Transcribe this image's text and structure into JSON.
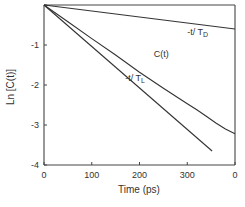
{
  "chart_data": {
    "type": "line",
    "title": "",
    "xlabel": "Time (ps)",
    "ylabel": "Ln [C(t)]",
    "xlim": [
      0,
      400
    ],
    "ylim": [
      -4,
      0
    ],
    "xticks": [
      0,
      100,
      200,
      300,
      400
    ],
    "xtick_labels": [
      "0",
      "100",
      "200",
      "300",
      "0"
    ],
    "yticks": [
      0,
      -1,
      -2,
      -3,
      -4
    ],
    "ytick_labels": [
      "",
      "-1",
      "-2",
      "-3",
      "-4"
    ],
    "grid": false,
    "legend": "none",
    "series": [
      {
        "name": "-t/T_D",
        "label_main": "-t/ T",
        "label_sub": "D",
        "x": [
          0,
          400
        ],
        "y": [
          0,
          -0.6
        ]
      },
      {
        "name": "C(t)",
        "label_main": "C(t)",
        "label_sub": "",
        "x": [
          0,
          50,
          100,
          150,
          200,
          250,
          300,
          320,
          340,
          360,
          380,
          400
        ],
        "y": [
          0,
          -0.42,
          -0.84,
          -1.25,
          -1.68,
          -2.08,
          -2.47,
          -2.62,
          -2.78,
          -2.95,
          -3.1,
          -3.22
        ]
      },
      {
        "name": "-t/T_L",
        "label_main": "-t/ T",
        "label_sub": "L",
        "x": [
          0,
          352
        ],
        "y": [
          0,
          -3.65
        ]
      }
    ],
    "annotations": [
      {
        "text": "-t/T_D",
        "x": 300,
        "y": -0.75
      },
      {
        "text": "C(t)",
        "x": 230,
        "y": -1.3
      },
      {
        "text": "-t/T_L",
        "x": 170,
        "y": -1.9
      }
    ]
  }
}
